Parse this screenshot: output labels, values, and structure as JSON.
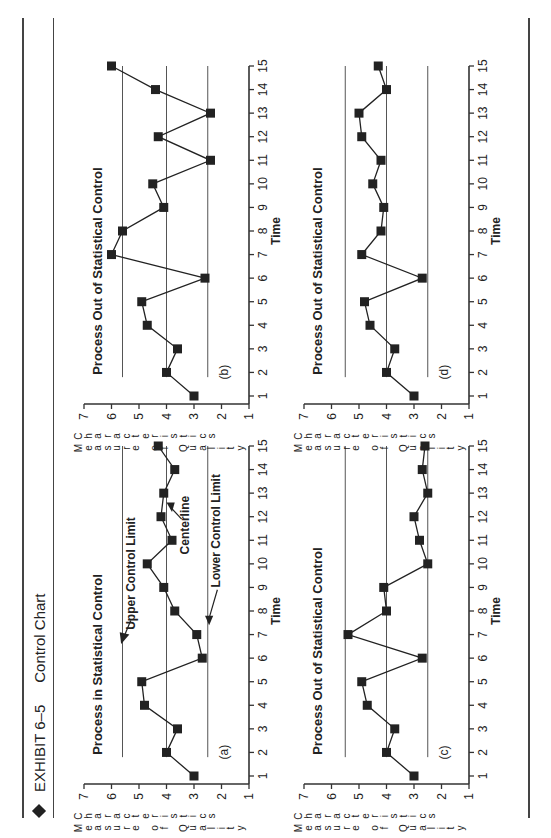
{
  "header": {
    "exhibit": "EXHIBIT 6–5",
    "title": "Control Chart"
  },
  "chart_data": [
    {
      "id": "a",
      "type": "line",
      "panel_label": "(a)",
      "title": "Process in Statistical Control",
      "xlabel": "Time",
      "ylabel": "Measure of Quality Characteristics",
      "x": [
        1,
        2,
        3,
        4,
        5,
        6,
        7,
        8,
        9,
        10,
        11,
        12,
        13,
        14,
        15
      ],
      "values": [
        3.0,
        4.0,
        3.6,
        4.8,
        4.9,
        2.7,
        2.9,
        3.7,
        4.1,
        4.7,
        3.8,
        4.2,
        4.1,
        3.7,
        4.3
      ],
      "ylim": [
        1,
        7
      ],
      "xlim": [
        1,
        15
      ],
      "yticks": [
        1,
        2,
        3,
        4,
        5,
        6,
        7
      ],
      "xticks": [
        1,
        2,
        3,
        4,
        5,
        6,
        7,
        8,
        9,
        10,
        11,
        12,
        13,
        14,
        15
      ],
      "control_limits": {
        "upper": 5.6,
        "center": 4.0,
        "lower": 2.5
      },
      "annotations": [
        "Upper Control Limit",
        "Centerline",
        "Lower Control Limit"
      ],
      "marker": "square",
      "grid": false
    },
    {
      "id": "b",
      "type": "line",
      "panel_label": "(b)",
      "title": "Process Out of Statistical Control",
      "xlabel": "Time",
      "ylabel": "Measure of Quality Characteristics",
      "x": [
        1,
        2,
        3,
        4,
        5,
        6,
        7,
        8,
        9,
        10,
        11,
        12,
        13,
        14,
        15
      ],
      "values": [
        3.0,
        4.0,
        3.6,
        4.7,
        4.9,
        2.6,
        6.0,
        5.6,
        4.1,
        4.5,
        2.4,
        4.3,
        2.4,
        4.4,
        6.0
      ],
      "ylim": [
        1,
        7
      ],
      "xlim": [
        1,
        15
      ],
      "yticks": [
        1,
        2,
        3,
        4,
        5,
        6,
        7
      ],
      "xticks": [
        1,
        2,
        3,
        4,
        5,
        6,
        7,
        8,
        9,
        10,
        11,
        12,
        13,
        14,
        15
      ],
      "control_limits": {
        "upper": 5.6,
        "center": 4.0,
        "lower": 2.5
      },
      "marker": "square",
      "grid": false
    },
    {
      "id": "c",
      "type": "line",
      "panel_label": "(c)",
      "title": "Process Out of Statistical Control",
      "xlabel": "Time",
      "ylabel": "Measure of Quality Characteristics",
      "x": [
        1,
        2,
        3,
        4,
        5,
        6,
        7,
        8,
        9,
        10,
        11,
        12,
        13,
        14,
        15
      ],
      "values": [
        3.0,
        4.0,
        3.7,
        4.7,
        4.9,
        2.7,
        5.4,
        4.0,
        4.1,
        2.5,
        2.8,
        3.0,
        2.5,
        2.7,
        2.6
      ],
      "ylim": [
        1,
        7
      ],
      "xlim": [
        1,
        15
      ],
      "yticks": [
        1,
        2,
        3,
        4,
        5,
        6,
        7
      ],
      "xticks": [
        1,
        2,
        3,
        4,
        5,
        6,
        7,
        8,
        9,
        10,
        11,
        12,
        13,
        14,
        15
      ],
      "control_limits": {
        "upper": 5.5,
        "center": 4.0,
        "lower": 2.5
      },
      "marker": "square",
      "grid": false
    },
    {
      "id": "d",
      "type": "line",
      "panel_label": "(d)",
      "title": "Process Out of Statistical Control",
      "xlabel": "Time",
      "ylabel": "Measure of Quality Characteristics",
      "x": [
        1,
        2,
        3,
        4,
        5,
        6,
        7,
        8,
        9,
        10,
        11,
        12,
        13,
        14,
        15
      ],
      "values": [
        3.0,
        4.0,
        3.7,
        4.6,
        4.8,
        2.7,
        4.9,
        4.2,
        4.1,
        4.5,
        4.2,
        4.9,
        5.0,
        4.0,
        4.3
      ],
      "ylim": [
        1,
        7
      ],
      "xlim": [
        1,
        15
      ],
      "yticks": [
        1,
        2,
        3,
        4,
        5,
        6,
        7
      ],
      "xticks": [
        1,
        2,
        3,
        4,
        5,
        6,
        7,
        8,
        9,
        10,
        11,
        12,
        13,
        14,
        15
      ],
      "control_limits": {
        "upper": 5.5,
        "center": 4.0,
        "lower": 2.5
      },
      "marker": "square",
      "grid": false
    }
  ],
  "ylabel_words": [
    "Measure",
    "of",
    "Quality",
    "Characteristics"
  ]
}
